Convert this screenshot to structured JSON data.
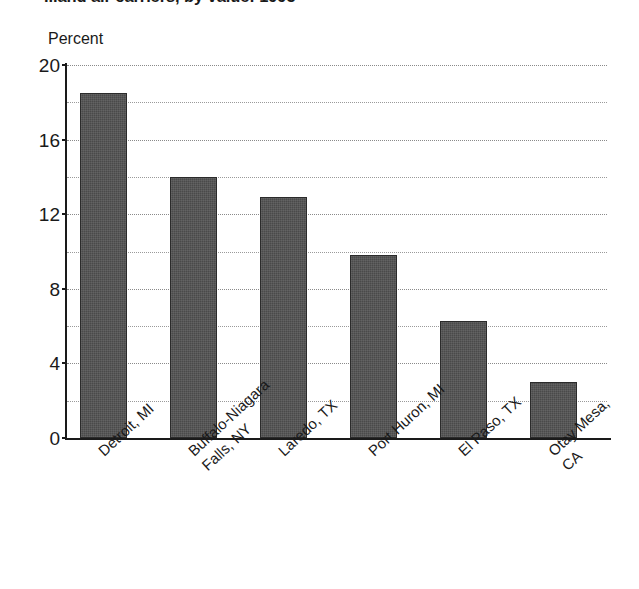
{
  "chart_data": {
    "type": "bar",
    "title": "...and air carriers, by value: 1995",
    "ylabel": "Percent",
    "xlabel": "",
    "categories": [
      "Detroit, MI",
      "Buffalo-Niagara\nFalls, NY",
      "Laredo, TX",
      "Port Huron, MI",
      "El Paso, TX",
      "Otay Mesa, CA"
    ],
    "values": [
      18.5,
      14.0,
      12.9,
      9.8,
      6.3,
      3.0
    ],
    "ylim": [
      0,
      20
    ],
    "y_major_ticks": [
      0,
      4,
      8,
      12,
      16,
      20
    ],
    "y_minor_gridlines": [
      2,
      6,
      10,
      14,
      18
    ],
    "y_tick_labels": [
      "0",
      "4",
      "8",
      "12",
      "16",
      "20"
    ],
    "grid": true,
    "legend": null,
    "bar_color": "#4a4a4a",
    "axis_color": "#1a1a1a",
    "grid_color": "#9a9a9a"
  }
}
